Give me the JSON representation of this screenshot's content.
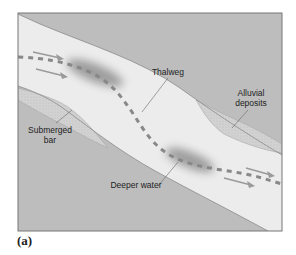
{
  "figure": {
    "caption": "(a)",
    "colors": {
      "bank": "#bdbdbd",
      "channel": "#ececec",
      "deposit": "#d4d4d4",
      "deep_water": "#8f8f8f",
      "thalweg": "#888888",
      "flow_arrow": "#9a9a9a",
      "frame": "#777777"
    }
  },
  "labels": {
    "thalweg": "Thalweg",
    "alluvial_line1": "Alluvial",
    "alluvial_line2": "deposits",
    "submerged_line1": "Submerged",
    "submerged_line2": "bar",
    "deeper_water": "Deeper water"
  },
  "flow_arrows": {
    "count": 4,
    "direction": "left-to-right (downstream)"
  }
}
